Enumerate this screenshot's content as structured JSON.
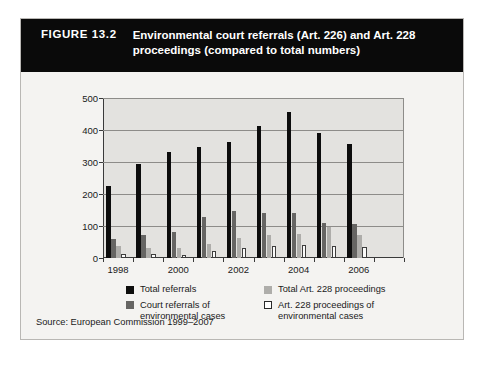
{
  "figure": {
    "number": "FIGURE 13.2",
    "title": "Environmental court referrals (Art. 226) and Art. 228 proceedings (compared to total numbers)",
    "source": "Source: European Commission 1999–2007"
  },
  "colors": {
    "banner_background": "#0a0a0a",
    "banner_text": "#ffffff",
    "figure_background": "#f4f3f1",
    "plot_background": "#e3e2df",
    "gridline": "#8d8c89",
    "axis": "#3a3a3a",
    "series_total_referrals": "#0d0d0d",
    "series_court_referrals_env": "#666563",
    "series_total_art228": "#aeadaa",
    "series_art228_env": "#ffffff"
  },
  "chart_data": {
    "type": "bar",
    "title": "Environmental court referrals (Art. 226) and Art. 228 proceedings (compared to total numbers)",
    "xlabel": "",
    "ylabel": "",
    "ylim": [
      0,
      500
    ],
    "yticks": [
      0,
      100,
      200,
      300,
      400,
      500
    ],
    "ytick_labels": [
      "0",
      "100",
      "200",
      "300",
      "400",
      "500"
    ],
    "grid": true,
    "legend_position": "below-axes",
    "categories": [
      "1998",
      "1999",
      "2000",
      "2001",
      "2002",
      "2003",
      "2004",
      "2005",
      "2006",
      "2007"
    ],
    "xtick_labels": [
      "1998",
      "2000",
      "2002",
      "2004",
      "2006"
    ],
    "xtick_label_categories": [
      "1998",
      "2000",
      "2002",
      "2004",
      "2006"
    ],
    "series": [
      {
        "name": "Total referrals",
        "color": "#0d0d0d",
        "values": [
          225,
          295,
          332,
          348,
          363,
          413,
          455,
          392,
          355,
          0
        ]
      },
      {
        "name": "Court referrals of environmental cases",
        "color": "#666563",
        "values": [
          58,
          72,
          82,
          127,
          148,
          142,
          142,
          110,
          105,
          0
        ]
      },
      {
        "name": "Total Art. 228 proceedings",
        "color": "#aeadaa",
        "values": [
          38,
          31,
          32,
          45,
          63,
          71,
          76,
          97,
          72,
          0
        ]
      },
      {
        "name": "Art. 228 proceedings of environmental cases",
        "color": "#ffffff",
        "values": [
          14,
          12,
          10,
          22,
          31,
          39,
          40,
          38,
          34,
          0
        ]
      }
    ]
  },
  "legend": {
    "items": [
      {
        "label": "Total referrals",
        "swatch": "sw0"
      },
      {
        "label": "Total Art. 228 proceedings",
        "swatch": "sw2"
      },
      {
        "label": "Court referrals of environmental cases",
        "swatch": "sw1"
      },
      {
        "label": "Art. 228 proceedings of environmental cases",
        "swatch": "sw3"
      }
    ]
  }
}
